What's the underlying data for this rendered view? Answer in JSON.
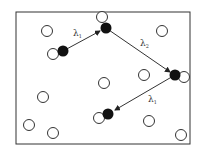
{
  "diagram": {
    "frame": {
      "x": 16,
      "y": 12,
      "width": 174,
      "height": 132,
      "stroke": "#333333"
    },
    "empty_circles": [
      {
        "x": 47,
        "y": 31
      },
      {
        "x": 102,
        "y": 17
      },
      {
        "x": 162,
        "y": 31
      },
      {
        "x": 53,
        "y": 54
      },
      {
        "x": 144,
        "y": 75
      },
      {
        "x": 104,
        "y": 83
      },
      {
        "x": 43,
        "y": 97
      },
      {
        "x": 29,
        "y": 125
      },
      {
        "x": 53,
        "y": 133
      },
      {
        "x": 149,
        "y": 121
      },
      {
        "x": 181,
        "y": 135
      },
      {
        "x": 184,
        "y": 77
      },
      {
        "x": 99,
        "y": 118
      }
    ],
    "filled_circles": [
      {
        "x": 63,
        "y": 51
      },
      {
        "x": 106,
        "y": 28
      },
      {
        "x": 175,
        "y": 75
      },
      {
        "x": 108,
        "y": 114
      }
    ],
    "arrows": [
      {
        "from": [
          63,
          51
        ],
        "to": [
          100,
          31
        ],
        "label": "λ",
        "subscript": "1",
        "label_x": 73,
        "label_y": 36
      },
      {
        "from": [
          106,
          28
        ],
        "to": [
          170,
          72
        ],
        "label": "λ",
        "subscript": "2",
        "label_x": 140,
        "label_y": 46
      },
      {
        "from": [
          175,
          75
        ],
        "to": [
          115,
          110
        ],
        "label": "λ",
        "subscript": "1",
        "label_x": 148,
        "label_y": 102
      }
    ],
    "colors": {
      "stroke": "#333333",
      "filled": "#111111",
      "empty": "#ffffff"
    }
  }
}
